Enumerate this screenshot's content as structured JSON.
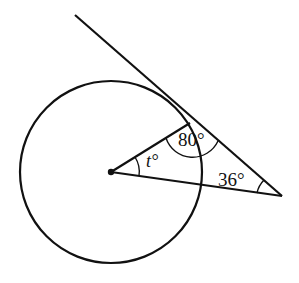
{
  "diagram": {
    "type": "circle-tangent-geometry",
    "labels": {
      "angle_at_tangent_point": "80°",
      "angle_at_external_point": "36°",
      "angle_at_center": "t°",
      "angle_at_center_var": "t",
      "degree_symbol": "°"
    },
    "colors": {
      "stroke": "#111111",
      "background": "#ffffff"
    }
  }
}
